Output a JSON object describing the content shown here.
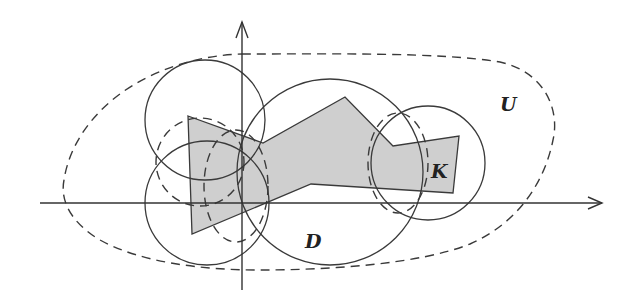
{
  "diagram": {
    "labels": {
      "U": "U",
      "K": "K",
      "D": "D"
    },
    "colors": {
      "fill_K": "#cfcfcf",
      "stroke": "#3a3a3a",
      "background": "#ffffff"
    },
    "axes": {
      "x_axis": {
        "from": [
          40,
          203
        ],
        "to": [
          602,
          203
        ]
      },
      "y_axis": {
        "from": [
          242,
          290
        ],
        "to": [
          242,
          22
        ]
      }
    },
    "elements": [
      {
        "id": "U",
        "type": "dashed closed curve",
        "role": "open set"
      },
      {
        "id": "K",
        "type": "shaded polygon",
        "role": "compact set"
      },
      {
        "id": "D",
        "type": "union of solid-outline disks",
        "role": "covering domain"
      },
      {
        "id": "inner-dashed-circles",
        "type": "dashed circles",
        "role": "smaller disks"
      }
    ]
  }
}
